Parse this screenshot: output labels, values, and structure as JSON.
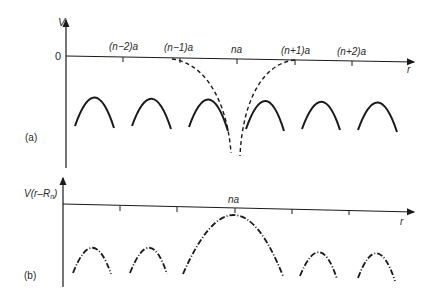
{
  "panel_a": {
    "label": "(a)",
    "y_axis_label": "V",
    "zero_label": "0",
    "x_axis_label": "r",
    "ticks": [
      "(n−2)a",
      "(n−1)a",
      "na",
      "(n+1)a",
      "(n+2)a"
    ],
    "curves": {
      "total_potential": "solid arcs between lattice sites",
      "single_ion_potential": "dashed Coulomb-like well centered at na"
    }
  },
  "panel_b": {
    "label": "(b)",
    "y_axis_label_main": "V(r–R",
    "y_axis_label_sub": "n",
    "y_axis_label_close": ")",
    "x_axis_label": "r",
    "center_tick": "na",
    "curves": {
      "shifted_potential": "dash-dot arcs, large arc centered at na"
    }
  },
  "colors": {
    "ink": "#1a1a1a",
    "background": "#ffffff"
  }
}
